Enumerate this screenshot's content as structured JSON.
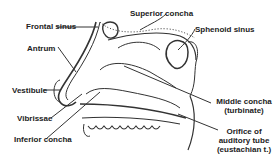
{
  "diagram": {
    "labels": {
      "frontal_sinus": "Frontal sinus",
      "superior_concha": "Superior concha",
      "sphenoid_sinus": "Sphenoid sinus",
      "antrum": "Antrum",
      "vestibule": "Vestibule",
      "vibrissae": "Vibrissae",
      "inferior_concha": "Inferior concha",
      "middle_concha_line1": "Middle concha",
      "middle_concha_line2": "(turbinate)",
      "orifice_line1": "Orifice of",
      "orifice_line2": "auditory tube",
      "orifice_line3": "(eustachian t.)"
    },
    "colors": {
      "ink": "#222222",
      "background": "#ffffff"
    }
  }
}
